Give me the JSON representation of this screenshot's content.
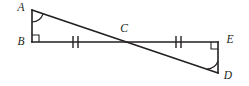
{
  "figure": {
    "width": 249,
    "height": 86,
    "background_color": "#ffffff",
    "stroke_color": "#231f20"
  },
  "vertices": [
    {
      "id": "A",
      "label": "A",
      "x": 32,
      "y": 10,
      "label_x": 21,
      "label_y": 8
    },
    {
      "id": "B",
      "label": "B",
      "x": 32,
      "y": 42,
      "label_x": 21,
      "label_y": 42
    },
    {
      "id": "C",
      "label": "C",
      "x": 125,
      "y": 42,
      "label_x": 124,
      "label_y": 29
    },
    {
      "id": "E",
      "label": "E",
      "x": 218,
      "y": 42,
      "label_x": 230,
      "label_y": 40
    },
    {
      "id": "D",
      "label": "D",
      "x": 218,
      "y": 73,
      "label_x": 228,
      "label_y": 76
    }
  ],
  "segments": [
    {
      "name": "segment-AB",
      "from": "A",
      "to": "B",
      "x1": 32,
      "y1": 10,
      "x2": 32,
      "y2": 42
    },
    {
      "name": "segment-BE",
      "from": "B",
      "to": "E",
      "x1": 32,
      "y1": 42,
      "x2": 218,
      "y2": 42
    },
    {
      "name": "segment-ED",
      "from": "E",
      "to": "D",
      "x1": 218,
      "y1": 42,
      "x2": 218,
      "y2": 73
    },
    {
      "name": "segment-AD",
      "from": "A",
      "to": "D",
      "x1": 32,
      "y1": 10,
      "x2": 218,
      "y2": 73
    }
  ],
  "right_angles": [
    {
      "name": "right-angle-B",
      "at": "B",
      "x": 32,
      "y": 42,
      "dir_x": 1,
      "dir_y": -1,
      "size": 7
    },
    {
      "name": "right-angle-E",
      "at": "E",
      "x": 218,
      "y": 42,
      "dir_x": -1,
      "dir_y": 1,
      "size": 7
    }
  ],
  "angle_arcs": [
    {
      "name": "angle-arc-A",
      "at": "A",
      "path": "M 32 22 A 12 12 0 0 0 43 14"
    },
    {
      "name": "angle-arc-D",
      "at": "D",
      "path": "M 218 61 A 12 12 0 0 1 207 69"
    }
  ],
  "tick_marks": [
    {
      "name": "tick-marks-BC",
      "on_segment": "BC",
      "count": 2,
      "marks": [
        {
          "x1": 73,
          "y1": 36,
          "x2": 73,
          "y2": 48
        },
        {
          "x1": 78,
          "y1": 36,
          "x2": 78,
          "y2": 48
        }
      ]
    },
    {
      "name": "tick-marks-CE",
      "on_segment": "CE",
      "count": 2,
      "marks": [
        {
          "x1": 176,
          "y1": 36,
          "x2": 176,
          "y2": 48
        },
        {
          "x1": 181,
          "y1": 36,
          "x2": 181,
          "y2": 48
        }
      ]
    }
  ]
}
